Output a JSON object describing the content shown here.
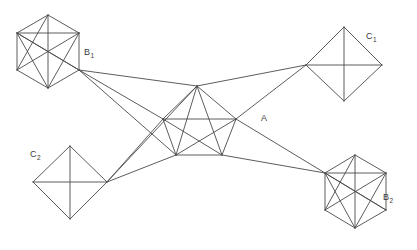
{
  "figure": {
    "background_color": "#ffffff",
    "line_color": "#4a4a4a",
    "width": 417,
    "height": 250
  },
  "labels": {
    "b1": {
      "base": "B",
      "sub": "1",
      "x": 84,
      "y": 55
    },
    "b2": {
      "base": "B",
      "sub": "2",
      "x": 383,
      "y": 200
    },
    "c1": {
      "base": "C",
      "sub": "1",
      "x": 366,
      "y": 39
    },
    "c2": {
      "base": "C",
      "sub": "2",
      "x": 30,
      "y": 157
    },
    "a": {
      "base": "A",
      "sub": "",
      "x": 261,
      "y": 121
    }
  },
  "chart_data": {
    "type": "diagram",
    "clusters": [
      {
        "id": "B1",
        "label": "B1",
        "shape": "hexagon",
        "vertices": [
          [
            48,
            15
          ],
          [
            79,
            33
          ],
          [
            79,
            70
          ],
          [
            48,
            88
          ],
          [
            17,
            70
          ],
          [
            17,
            33
          ]
        ],
        "internal_edges": [
          [
            0,
            1
          ],
          [
            1,
            2
          ],
          [
            2,
            3
          ],
          [
            3,
            4
          ],
          [
            4,
            5
          ],
          [
            5,
            0
          ],
          [
            0,
            3
          ],
          [
            1,
            4
          ],
          [
            2,
            5
          ],
          [
            1,
            3
          ],
          [
            4,
            0
          ],
          [
            5,
            2
          ],
          [
            5,
            3
          ],
          [
            1,
            5
          ]
        ]
      },
      {
        "id": "C1",
        "label": "C1",
        "shape": "diamond",
        "vertices": [
          [
            344,
            27
          ],
          [
            382,
            65
          ],
          [
            344,
            101
          ],
          [
            306,
            65
          ]
        ],
        "internal_edges": [
          [
            0,
            1
          ],
          [
            1,
            2
          ],
          [
            2,
            3
          ],
          [
            3,
            0
          ],
          [
            0,
            2
          ],
          [
            1,
            3
          ]
        ]
      },
      {
        "id": "C2",
        "label": "C2",
        "shape": "diamond",
        "vertices": [
          [
            70,
            146
          ],
          [
            107,
            182
          ],
          [
            70,
            219
          ],
          [
            33,
            182
          ]
        ],
        "internal_edges": [
          [
            0,
            1
          ],
          [
            1,
            2
          ],
          [
            2,
            3
          ],
          [
            3,
            0
          ],
          [
            0,
            2
          ],
          [
            1,
            3
          ]
        ]
      },
      {
        "id": "B2",
        "label": "B2",
        "shape": "hexagon",
        "vertices": [
          [
            355,
            155
          ],
          [
            386,
            173
          ],
          [
            386,
            210
          ],
          [
            355,
            228
          ],
          [
            325,
            210
          ],
          [
            325,
            173
          ]
        ],
        "internal_edges": [
          [
            0,
            1
          ],
          [
            1,
            2
          ],
          [
            2,
            3
          ],
          [
            3,
            4
          ],
          [
            4,
            5
          ],
          [
            5,
            0
          ],
          [
            0,
            3
          ],
          [
            1,
            4
          ],
          [
            2,
            5
          ],
          [
            1,
            3
          ],
          [
            4,
            0
          ],
          [
            5,
            2
          ],
          [
            5,
            3
          ],
          [
            1,
            5
          ]
        ]
      },
      {
        "id": "A",
        "label": "A",
        "shape": "pentagon",
        "vertices": [
          [
            197,
            86
          ],
          [
            236,
            119
          ],
          [
            222,
            155
          ],
          [
            176,
            155
          ],
          [
            163,
            119
          ]
        ],
        "internal_edges": [
          [
            0,
            1
          ],
          [
            1,
            2
          ],
          [
            2,
            3
          ],
          [
            3,
            4
          ],
          [
            4,
            0
          ],
          [
            0,
            2
          ],
          [
            0,
            3
          ],
          [
            1,
            3
          ],
          [
            1,
            4
          ],
          [
            2,
            4
          ]
        ]
      }
    ],
    "inter_cluster_edges": [
      {
        "from": "B1",
        "from_vertex": 2,
        "to": "A",
        "to_vertex": 0
      },
      {
        "from": "B1",
        "from_vertex": 2,
        "to": "A",
        "to_vertex": 3
      },
      {
        "from": "B1",
        "from_vertex": 2,
        "to": "A",
        "to_vertex": 4
      },
      {
        "from": "A",
        "from_vertex": 0,
        "to": "C1",
        "to_vertex": 3
      },
      {
        "from": "A",
        "from_vertex": 1,
        "to": "C1",
        "to_vertex": 3
      },
      {
        "from": "A",
        "from_vertex": 4,
        "to": "C2",
        "to_vertex": 1
      },
      {
        "from": "A",
        "from_vertex": 3,
        "to": "C2",
        "to_vertex": 1
      },
      {
        "from": "A",
        "from_vertex": 1,
        "to": "B2",
        "to_vertex": 5
      },
      {
        "from": "A",
        "from_vertex": 2,
        "to": "B2",
        "to_vertex": 5
      },
      {
        "from": "C2",
        "from_vertex": 1,
        "to": "A",
        "to_vertex": 0
      }
    ]
  }
}
